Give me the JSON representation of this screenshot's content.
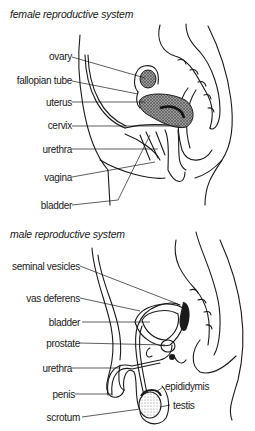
{
  "female": {
    "title": "female reproductive system",
    "labels": {
      "ovary": "ovary",
      "fallopian_tube": "fallopian tube",
      "uterus": "uterus",
      "cervix": "cervix",
      "urethra": "urethra",
      "vagina": "vagina",
      "bladder": "bladder"
    }
  },
  "male": {
    "title": "male reproductive system",
    "labels": {
      "seminal_vesicles": "seminal vesicles",
      "vas_deferens": "vas deferens",
      "bladder": "bladder",
      "prostate": "prostate",
      "urethra": "urethra",
      "penis": "penis",
      "scrotum": "scrotum",
      "epididymis": "epididymis",
      "testis": "testis"
    }
  },
  "colors": {
    "ink": "#1a1a1a",
    "background": "#ffffff",
    "stipple": "#555555"
  }
}
